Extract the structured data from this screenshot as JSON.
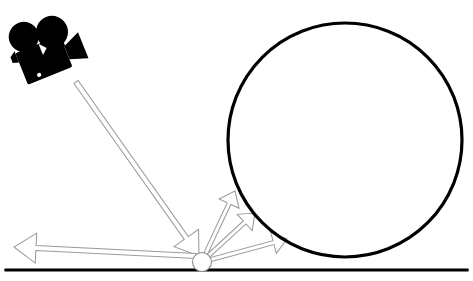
{
  "figure": {
    "name": "ray-tracing-camera-scene",
    "background_color": "#ffffff",
    "width": 473,
    "height": 281,
    "stroke_color": "#000000",
    "ray_stroke_color": "#9a9a9a",
    "ray_fill_color": "#ffffff"
  },
  "ground": {
    "name": "ground-line",
    "x1": 6,
    "y1": 270,
    "x2": 467,
    "y2": 270,
    "thickness": 3.2,
    "color": "#000000"
  },
  "sphere": {
    "name": "large-circle",
    "cx": 345,
    "cy": 140,
    "r": 117,
    "stroke_width": 3.2,
    "stroke_color": "#000000",
    "fill": "none"
  },
  "hit_point": {
    "name": "intersection-point",
    "cx": 202,
    "cy": 262,
    "r": 9.5,
    "stroke_width": 1.1,
    "stroke_color": "#8d8d8d",
    "fill": "#ffffff"
  },
  "camera": {
    "name": "movie-camera-icon",
    "cx": 45,
    "cy": 52,
    "rotation_deg": -22,
    "color": "#000000"
  },
  "rays": [
    {
      "name": "incident-ray",
      "label": "incident",
      "from": [
        76,
        82
      ],
      "to": [
        199,
        256
      ],
      "width": 5.0,
      "head_length": 22,
      "head_width": 15
    },
    {
      "name": "reflected-ray-left",
      "label": "reflected-left",
      "from": [
        196,
        256
      ],
      "to": [
        14,
        247
      ],
      "width": 5.0,
      "head_length": 22,
      "head_width": 15
    },
    {
      "name": "reflected-ray-up",
      "label": "reflected-up",
      "from": [
        205,
        255
      ],
      "to": [
        235,
        191
      ],
      "width": 4.0,
      "head_length": 14,
      "head_width": 11
    },
    {
      "name": "reflected-ray-mid",
      "label": "reflected-mid",
      "from": [
        207,
        257
      ],
      "to": [
        255,
        213
      ],
      "width": 4.0,
      "head_length": 14,
      "head_width": 11
    },
    {
      "name": "reflected-ray-right",
      "label": "reflected-right",
      "from": [
        209,
        260
      ],
      "to": [
        287,
        239
      ],
      "width": 4.0,
      "head_length": 14,
      "head_width": 11
    }
  ]
}
